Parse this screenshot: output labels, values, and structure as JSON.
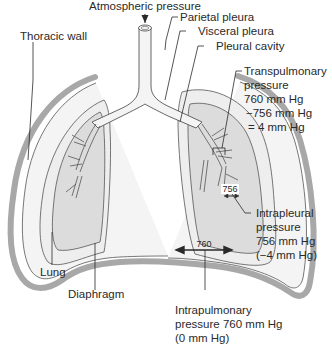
{
  "diagram": {
    "type": "anatomical",
    "labels": {
      "atmospheric": "Atmospheric pressure",
      "thoracic_wall": "Thoracic wall",
      "parietal_pleura": "Parietal pleura",
      "visceral_pleura": "Visceral pleura",
      "pleural_cavity": "Pleural cavity",
      "transpulmonary": [
        "Transpulmonary",
        "pressure",
        "760 mm Hg",
        "−756 mm Hg",
        "= 4 mm Hg"
      ],
      "intrapleural": [
        "Intrapleural",
        "pressure",
        "756 mm Hg",
        "(−4 mm Hg)"
      ],
      "intrapulmonary": [
        "Intrapulmonary",
        "pressure 760 mm Hg",
        "(0 mm Hg)"
      ],
      "lung": "Lung",
      "diaphragm": "Diaphragm"
    },
    "measurements": {
      "intrapulmonary_value": "760",
      "intrapleural_value": "756"
    },
    "colors": {
      "wall": "#a8a8a8",
      "lung_fill": "#dcdcdc",
      "pleura_fill": "#eeeeee",
      "line": "#2a2a2a",
      "outline": "#555555"
    }
  }
}
